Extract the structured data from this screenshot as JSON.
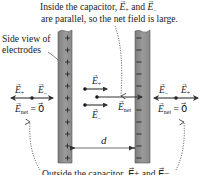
{
  "diagram": {
    "top_caption": {
      "line1": "Inside the capacitor, E⃗+ and E⃗−",
      "line1_prefix": "Inside the capacitor, ",
      "line2": "are parallel, so the net field is large."
    },
    "side_label": {
      "line1": "Side view of",
      "line2": "electrodes"
    },
    "left_plate": {
      "charge_sign": "+",
      "sign_count": 11,
      "color": "#8a8a8a"
    },
    "right_plate": {
      "charge_sign": "−",
      "sign_count": 11,
      "color": "#8a8a8a"
    },
    "left_outside": {
      "e_plus": "E",
      "e_plus_sub": "+",
      "e_minus": "E",
      "e_minus_sub": "−",
      "net": "E",
      "net_sub": "net",
      "net_value": "= 0⃗"
    },
    "inside": {
      "e_plus": "E",
      "e_plus_sub": "+",
      "e_minus": "E",
      "e_minus_sub": "−",
      "net": "E",
      "net_sub": "net"
    },
    "right_outside": {
      "e_minus": "E",
      "e_minus_sub": "−",
      "e_plus": "E",
      "e_plus_sub": "+",
      "net": "E",
      "net_sub": "net",
      "net_value": "= 0⃗"
    },
    "separation_label": "d",
    "bottom_caption_partial": "Outside the capacitor, E⃗+ and E⃗−"
  }
}
